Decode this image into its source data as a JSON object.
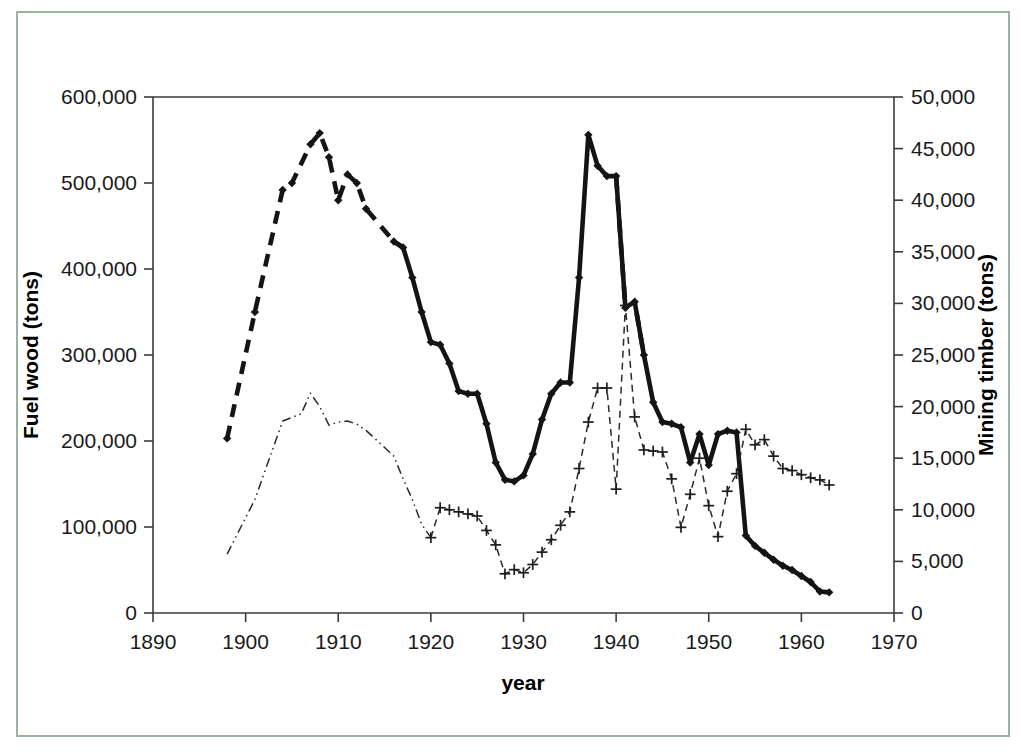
{
  "figure": {
    "border_color": "#9ab3a2",
    "background_color": "#ffffff"
  },
  "chart_data": {
    "type": "line",
    "title": "",
    "subtitle": "",
    "xlabel": "year",
    "ylabel": "Fuel wood (tons)",
    "y2label": "Mining timber (tons)",
    "xlim": [
      1890,
      1970
    ],
    "ylim": [
      0,
      600000
    ],
    "y2lim": [
      0,
      50000
    ],
    "xticks": [
      1890,
      1900,
      1910,
      1920,
      1930,
      1940,
      1950,
      1960,
      1970
    ],
    "xtick_labels": [
      "1890",
      "1900",
      "1910",
      "1920",
      "1930",
      "1940",
      "1950",
      "1960",
      "1970"
    ],
    "yticks": [
      0,
      100000,
      200000,
      300000,
      400000,
      500000,
      600000
    ],
    "ytick_labels": [
      "0",
      "100,000",
      "200,000",
      "300,000",
      "400,000",
      "500,000",
      "600,000"
    ],
    "y2ticks": [
      0,
      5000,
      10000,
      15000,
      20000,
      25000,
      30000,
      35000,
      40000,
      45000,
      50000
    ],
    "y2tick_labels": [
      "0",
      "5,000",
      "10,000",
      "15,000",
      "20,000",
      "25,000",
      "30,000",
      "35,000",
      "40,000",
      "45,000",
      "50,000"
    ],
    "grid": false,
    "legend": null,
    "legend_position": "none",
    "series": [
      {
        "name": "Fuel wood",
        "axis": "left",
        "units": "tons",
        "marker": "diamond",
        "line_style": "mixed-dashed-solid",
        "line_color": "#141414",
        "x": [
          1898,
          1901,
          1904,
          1905,
          1907,
          1908,
          1909,
          1910,
          1911,
          1912,
          1913,
          1916,
          1917,
          1918,
          1919,
          1920,
          1921,
          1922,
          1923,
          1924,
          1925,
          1926,
          1927,
          1928,
          1929,
          1930,
          1931,
          1932,
          1933,
          1934,
          1935,
          1936,
          1937,
          1938,
          1939,
          1940,
          1941,
          1942,
          1943,
          1944,
          1945,
          1946,
          1947,
          1948,
          1949,
          1950,
          1951,
          1952,
          1953,
          1954,
          1955,
          1956,
          1957,
          1958,
          1959,
          1960,
          1961,
          1962,
          1963
        ],
        "values": [
          203000,
          350000,
          492000,
          500000,
          545000,
          558000,
          530000,
          480000,
          510000,
          500000,
          470000,
          432000,
          425000,
          390000,
          350000,
          315000,
          312000,
          290000,
          258000,
          255000,
          255000,
          220000,
          175000,
          155000,
          153000,
          160000,
          185000,
          225000,
          255000,
          268000,
          268000,
          390000,
          556000,
          520000,
          508000,
          508000,
          355000,
          362000,
          300000,
          245000,
          222000,
          220000,
          216000,
          175000,
          208000,
          172000,
          208000,
          212000,
          210000,
          90000,
          78000,
          70000,
          62000,
          55000,
          50000,
          43000,
          36000,
          25000,
          24000
        ]
      },
      {
        "name": "Mining timber",
        "axis": "right",
        "units": "tons",
        "marker": "plus",
        "line_style": "mixed-dashdot-dashed",
        "line_color": "#2a2a2a",
        "x": [
          1898,
          1901,
          1904,
          1906,
          1907,
          1908,
          1909,
          1910,
          1911,
          1912,
          1913,
          1916,
          1917,
          1918,
          1919,
          1920,
          1921,
          1922,
          1923,
          1924,
          1925,
          1926,
          1927,
          1928,
          1929,
          1930,
          1931,
          1932,
          1933,
          1934,
          1935,
          1936,
          1937,
          1938,
          1939,
          1940,
          1941,
          1942,
          1943,
          1944,
          1945,
          1946,
          1947,
          1948,
          1949,
          1950,
          1951,
          1952,
          1953,
          1954,
          1955,
          1956,
          1957,
          1958,
          1959,
          1960,
          1961,
          1962,
          1963
        ],
        "values": [
          5700,
          11000,
          18600,
          19300,
          21300,
          20000,
          18200,
          18500,
          18600,
          18300,
          17700,
          15200,
          13000,
          11000,
          8600,
          7300,
          10200,
          10000,
          9800,
          9600,
          9400,
          8000,
          6600,
          3800,
          4200,
          3900,
          4700,
          5900,
          7100,
          8500,
          9800,
          14000,
          18500,
          21800,
          21800,
          12000,
          29800,
          19000,
          15800,
          15700,
          15600,
          13000,
          8300,
          11500,
          15000,
          10400,
          7400,
          11800,
          13500,
          17800,
          16300,
          16800,
          15200,
          14000,
          13800,
          13400,
          13100,
          12900,
          12400
        ]
      }
    ],
    "annotations": []
  },
  "axes": {
    "left_title": "Fuel wood (tons)",
    "right_title": "Mining timber (tons)",
    "bottom_title": "year"
  }
}
